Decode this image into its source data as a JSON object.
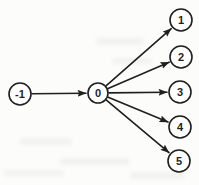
{
  "figure": {
    "background_color": "#fcfcfb",
    "ink_color": "#1f1f1f",
    "node_fill_color": "#ffffff",
    "line_width": 1.6,
    "label_font_size": 11
  },
  "diagram": {
    "type": "directed-graph",
    "nodes": [
      {
        "id": "n-1",
        "label": "-1",
        "x": 20,
        "y": 94,
        "r": 11
      },
      {
        "id": "n0",
        "label": "0",
        "x": 98,
        "y": 93,
        "r": 10
      },
      {
        "id": "n1",
        "label": "1",
        "x": 181,
        "y": 20,
        "r": 11
      },
      {
        "id": "n2",
        "label": "2",
        "x": 181,
        "y": 57,
        "r": 11
      },
      {
        "id": "n3",
        "label": "3",
        "x": 180,
        "y": 92,
        "r": 11
      },
      {
        "id": "n4",
        "label": "4",
        "x": 180,
        "y": 127,
        "r": 11
      },
      {
        "id": "n5",
        "label": "5",
        "x": 179,
        "y": 161,
        "r": 11
      }
    ],
    "edges": [
      {
        "from": "n-1",
        "to": "n0"
      },
      {
        "from": "n0",
        "to": "n1"
      },
      {
        "from": "n0",
        "to": "n2"
      },
      {
        "from": "n0",
        "to": "n3"
      },
      {
        "from": "n0",
        "to": "n4"
      },
      {
        "from": "n0",
        "to": "n5"
      }
    ]
  }
}
